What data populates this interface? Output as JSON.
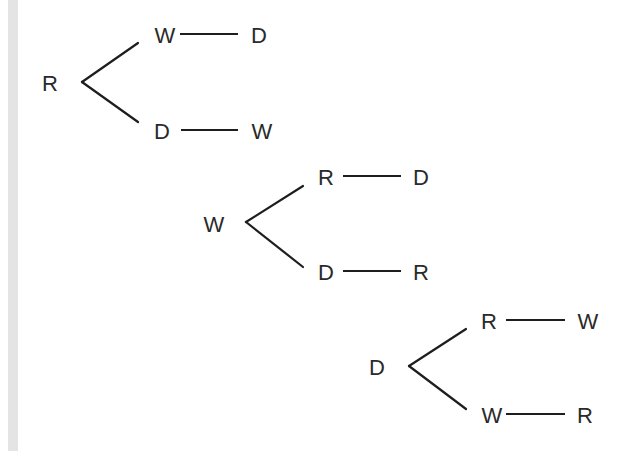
{
  "diagram": {
    "type": "tree",
    "colors": {
      "line": "#1e1e1e",
      "text": "#2a2a2a",
      "side_strip": "#e4e4e4"
    },
    "trees": [
      {
        "root": {
          "label": "R",
          "x": 50,
          "y": 83
        },
        "vertex": {
          "x": 82,
          "y": 82
        },
        "branches": [
          {
            "end": {
              "x": 138,
              "y": 43
            },
            "first": {
              "label": "W",
              "x": 165,
              "y": 35
            },
            "dash": {
              "x1": 180,
              "x2": 238,
              "y": 34
            },
            "second": {
              "label": "D",
              "x": 259,
              "y": 35
            }
          },
          {
            "end": {
              "x": 138,
              "y": 122
            },
            "first": {
              "label": "D",
              "x": 162,
              "y": 131
            },
            "dash": {
              "x1": 181,
              "x2": 238,
              "y": 130
            },
            "second": {
              "label": "W",
              "x": 262,
              "y": 131
            }
          }
        ]
      },
      {
        "root": {
          "label": "W",
          "x": 214,
          "y": 224
        },
        "vertex": {
          "x": 246,
          "y": 222
        },
        "branches": [
          {
            "end": {
              "x": 303,
              "y": 186
            },
            "first": {
              "label": "R",
              "x": 326,
              "y": 177
            },
            "dash": {
              "x1": 343,
              "x2": 401,
              "y": 176
            },
            "second": {
              "label": "D",
              "x": 421,
              "y": 177
            }
          },
          {
            "end": {
              "x": 303,
              "y": 267
            },
            "first": {
              "label": "D",
              "x": 326,
              "y": 272
            },
            "dash": {
              "x1": 343,
              "x2": 401,
              "y": 271
            },
            "second": {
              "label": "R",
              "x": 421,
              "y": 272
            }
          }
        ]
      },
      {
        "root": {
          "label": "D",
          "x": 377,
          "y": 367
        },
        "vertex": {
          "x": 409,
          "y": 366
        },
        "branches": [
          {
            "end": {
              "x": 466,
              "y": 329
            },
            "first": {
              "label": "R",
              "x": 489,
              "y": 321
            },
            "dash": {
              "x1": 506,
              "x2": 565,
              "y": 320
            },
            "second": {
              "label": "W",
              "x": 588,
              "y": 321
            }
          },
          {
            "end": {
              "x": 466,
              "y": 409
            },
            "first": {
              "label": "W",
              "x": 492,
              "y": 415
            },
            "dash": {
              "x1": 506,
              "x2": 565,
              "y": 414
            },
            "second": {
              "label": "R",
              "x": 585,
              "y": 415
            }
          }
        ]
      }
    ]
  }
}
